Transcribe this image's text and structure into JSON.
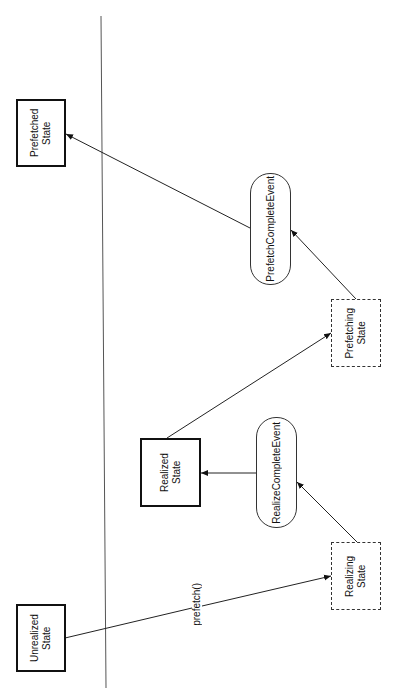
{
  "diagram": {
    "type": "state-diagram",
    "orientation": "rotated-90-ccw",
    "nodes": {
      "prefetched": {
        "label": "Prefetched State",
        "style": "solid"
      },
      "prefetch_complete": {
        "label": "PrefetchCompleteEvent",
        "style": "rounded"
      },
      "prefetching": {
        "label": "Prefetching\nState",
        "style": "dashed"
      },
      "realized": {
        "label": "Realized State",
        "style": "solid"
      },
      "realize_complete": {
        "label": "RealizeCompleteEvent",
        "style": "rounded"
      },
      "realizing": {
        "label": "Realizing State",
        "style": "dashed"
      },
      "unrealized": {
        "label": "Unrealized State",
        "style": "solid"
      }
    },
    "edges": [
      {
        "from": "unrealized",
        "to": "realizing",
        "label": "prefetch()"
      },
      {
        "from": "realizing",
        "to": "realize_complete",
        "label": ""
      },
      {
        "from": "realize_complete",
        "to": "realized",
        "label": ""
      },
      {
        "from": "realized",
        "to": "prefetching",
        "label": ""
      },
      {
        "from": "prefetching",
        "to": "prefetch_complete",
        "label": ""
      },
      {
        "from": "prefetch_complete",
        "to": "prefetched",
        "label": ""
      }
    ]
  }
}
